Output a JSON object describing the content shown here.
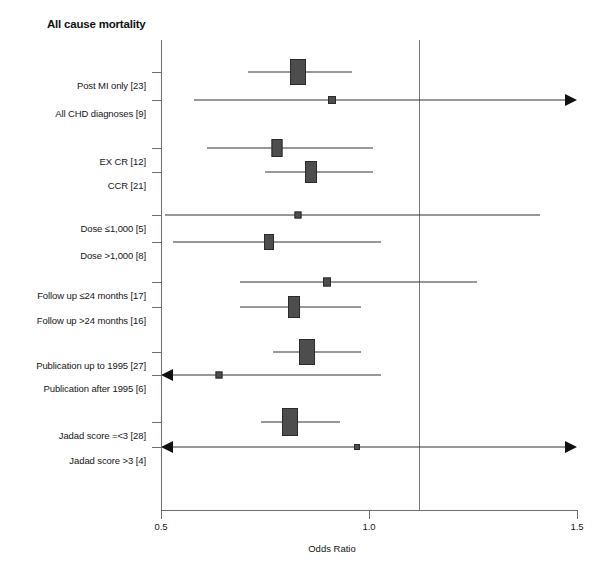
{
  "title": "All cause mortality",
  "chart_data": {
    "type": "forest",
    "title": "All cause mortality",
    "xlabel": "Odds Ratio",
    "ylabel": "",
    "xlim": [
      0.5,
      1.5
    ],
    "xticks": [
      0.5,
      1.0,
      1.5
    ],
    "xtick_labels": [
      "0.5",
      "1.0",
      "1.5"
    ],
    "null_line": 1.0,
    "grid": false,
    "legend": "none",
    "rows": [
      {
        "label": "Post MI only [23]",
        "n": 23,
        "or": 0.83,
        "ci_low": 0.71,
        "ci_high": 0.96,
        "marker": "box",
        "box_w": 14,
        "box_h": 24,
        "arrow_low": false,
        "arrow_high": false,
        "y": 72
      },
      {
        "label": "All CHD diagnoses [9]",
        "n": 9,
        "or": 0.91,
        "ci_low": 0.58,
        "ci_high": 1.5,
        "marker": "box",
        "box_w": 6,
        "box_h": 6,
        "arrow_low": false,
        "arrow_high": true,
        "y": 100
      },
      {
        "label": "EX CR [12]",
        "n": 12,
        "or": 0.78,
        "ci_low": 0.61,
        "ci_high": 1.01,
        "marker": "box",
        "box_w": 9,
        "box_h": 16,
        "arrow_low": false,
        "arrow_high": false,
        "y": 148
      },
      {
        "label": "CCR [21]",
        "n": 21,
        "or": 0.86,
        "ci_low": 0.75,
        "ci_high": 1.01,
        "marker": "box",
        "box_w": 10,
        "box_h": 20,
        "arrow_low": false,
        "arrow_high": false,
        "y": 172
      },
      {
        "label": "Dose ≤1,000 [5]",
        "n": 5,
        "or": 0.83,
        "ci_low": 0.51,
        "ci_high": 1.41,
        "marker": "box",
        "box_w": 5,
        "box_h": 5,
        "arrow_low": false,
        "arrow_high": false,
        "y": 215
      },
      {
        "label": "Dose >1,000 [8]",
        "n": 8,
        "or": 0.76,
        "ci_low": 0.53,
        "ci_high": 1.03,
        "marker": "box",
        "box_w": 8,
        "box_h": 14,
        "arrow_low": false,
        "arrow_high": false,
        "y": 242
      },
      {
        "label": "Follow up ≤24 months [17]",
        "n": 17,
        "or": 0.9,
        "ci_low": 0.69,
        "ci_high": 1.26,
        "marker": "box",
        "box_w": 6,
        "box_h": 7,
        "arrow_low": false,
        "arrow_high": false,
        "y": 282
      },
      {
        "label": "Follow up >24 months [16]",
        "n": 16,
        "or": 0.82,
        "ci_low": 0.69,
        "ci_high": 0.98,
        "marker": "box",
        "box_w": 10,
        "box_h": 20,
        "arrow_low": false,
        "arrow_high": false,
        "y": 307
      },
      {
        "label": "Publication up to 1995 [27]",
        "n": 27,
        "or": 0.85,
        "ci_low": 0.77,
        "ci_high": 0.98,
        "marker": "box",
        "box_w": 14,
        "box_h": 24,
        "arrow_low": false,
        "arrow_high": false,
        "y": 352
      },
      {
        "label": "Publication after 1995 [6]",
        "n": 6,
        "or": 0.64,
        "ci_low": 0.5,
        "ci_high": 1.03,
        "marker": "box",
        "box_w": 5,
        "box_h": 5,
        "arrow_low": true,
        "arrow_high": false,
        "y": 375
      },
      {
        "label": "Jadad score =<3 [28]",
        "n": 28,
        "or": 0.81,
        "ci_low": 0.74,
        "ci_high": 0.93,
        "marker": "box",
        "box_w": 14,
        "box_h": 26,
        "arrow_low": false,
        "arrow_high": false,
        "y": 422
      },
      {
        "label": "Jadad score >3 [4]",
        "n": 4,
        "or": 0.97,
        "ci_low": 0.5,
        "ci_high": 1.5,
        "marker": "box",
        "box_w": 4,
        "box_h": 4,
        "arrow_low": true,
        "arrow_high": true,
        "y": 447
      }
    ]
  },
  "geometry": {
    "x_left_px": 161,
    "x_right_px": 577,
    "or_left": 0.5,
    "or_right": 1.5
  }
}
